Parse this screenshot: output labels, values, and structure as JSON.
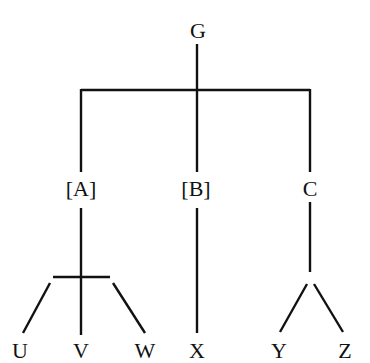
{
  "diagram": {
    "type": "tree",
    "root": {
      "id": "G",
      "label": "G"
    },
    "level1": [
      {
        "id": "A",
        "label": "[A]"
      },
      {
        "id": "B",
        "label": "[B]"
      },
      {
        "id": "C",
        "label": "C"
      }
    ],
    "leaves": [
      {
        "id": "U",
        "label": "U",
        "parent": "A"
      },
      {
        "id": "V",
        "label": "V",
        "parent": "A"
      },
      {
        "id": "W",
        "label": "W",
        "parent": "A"
      },
      {
        "id": "X",
        "label": "X",
        "parent": "B"
      },
      {
        "id": "Y",
        "label": "Y",
        "parent": "C"
      },
      {
        "id": "Z",
        "label": "Z",
        "parent": "C"
      }
    ],
    "edges": [
      [
        "G",
        "A"
      ],
      [
        "G",
        "B"
      ],
      [
        "G",
        "C"
      ],
      [
        "A",
        "U"
      ],
      [
        "A",
        "V"
      ],
      [
        "A",
        "W"
      ],
      [
        "B",
        "X"
      ],
      [
        "C",
        "Y"
      ],
      [
        "C",
        "Z"
      ]
    ],
    "colors": {
      "line": "#111111",
      "background": "#ffffff"
    }
  }
}
